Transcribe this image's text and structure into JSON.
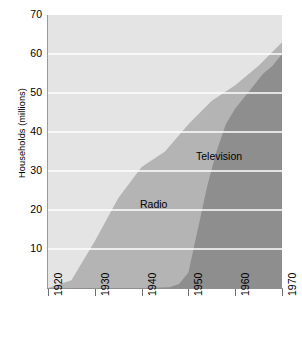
{
  "chart_data": {
    "type": "area",
    "stacked": true,
    "title": "",
    "xlabel": "",
    "ylabel": "Households (millions)",
    "xlim": [
      1920,
      1970
    ],
    "ylim": [
      0,
      70
    ],
    "grid": true,
    "grid_color": "#ffffff",
    "plot_background": "#e4e4e4",
    "legend_position": "inside-plot",
    "xticks": [
      1920,
      1930,
      1940,
      1950,
      1960,
      1970
    ],
    "xtick_labels": [
      "1920",
      "1930",
      "1940",
      "1950",
      "1960",
      "1970"
    ],
    "yticks": [
      10,
      20,
      30,
      40,
      50,
      60,
      70
    ],
    "ytick_labels": [
      "10",
      "20",
      "30",
      "40",
      "50",
      "60",
      "70"
    ],
    "series": [
      {
        "name": "Television",
        "color": "#8e8e8e",
        "x": [
          1920,
          1925,
          1930,
          1935,
          1940,
          1946,
          1948,
          1950,
          1952,
          1954,
          1956,
          1958,
          1960,
          1962,
          1964,
          1966,
          1968,
          1970
        ],
        "values": [
          0,
          0,
          0,
          0,
          0,
          0.2,
          1,
          4,
          15,
          26,
          35,
          42,
          46,
          49,
          52,
          55,
          57,
          60
        ]
      },
      {
        "name": "Radio",
        "color": "#b4b4b4",
        "x": [
          1920,
          1922,
          1924,
          1925,
          1926,
          1928,
          1930,
          1932,
          1934,
          1936,
          1938,
          1940,
          1942,
          1944,
          1946,
          1948,
          1950,
          1952,
          1954,
          1956,
          1958,
          1960,
          1962,
          1964,
          1966,
          1968,
          1970
        ],
        "values": [
          0,
          0.1,
          1,
          2,
          3,
          6,
          12,
          17,
          21,
          25,
          28,
          31,
          33,
          34,
          35,
          38,
          41,
          43,
          44,
          45,
          46,
          47,
          48,
          48,
          47,
          45,
          44
        ]
      }
    ],
    "total_top": {
      "name": "Total households with radio or television",
      "x": [
        1920,
        1925,
        1930,
        1935,
        1940,
        1945,
        1950,
        1955,
        1960,
        1965,
        1970
      ],
      "values": [
        0,
        2,
        12,
        23,
        31,
        35,
        42,
        48,
        52,
        57,
        63
      ]
    },
    "annotations": [
      {
        "text": "Radio",
        "x": 1950,
        "y": 22
      },
      {
        "text": "Television",
        "x": 1958,
        "y": 33
      }
    ]
  }
}
